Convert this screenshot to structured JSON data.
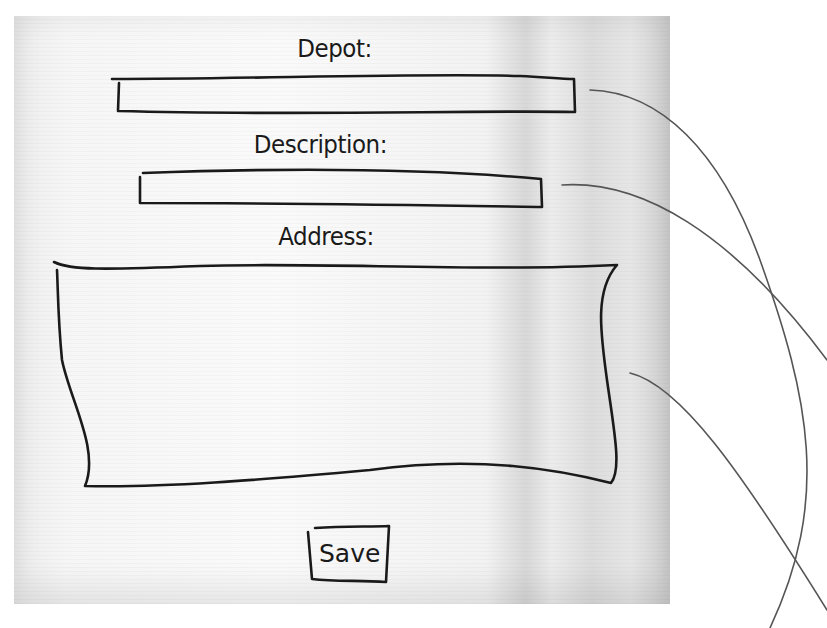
{
  "form": {
    "depot_label": "Depot:",
    "description_label": "Description:",
    "address_label": "Address:",
    "depot_value": "",
    "description_value": "",
    "address_value": "",
    "save_label": "Save"
  },
  "colors": {
    "ink": "#1a1a1a",
    "connector": "#555555",
    "napkin": "#f4f4f4"
  }
}
